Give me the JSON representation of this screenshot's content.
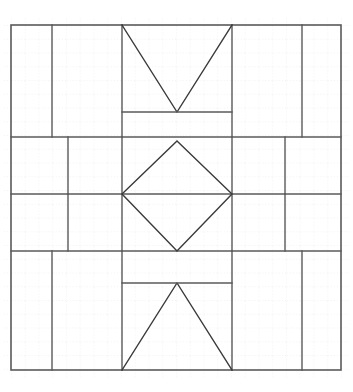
{
  "page": {
    "background_color": "#ffffff",
    "width": 353,
    "height": 392
  },
  "graph_paper": {
    "visible": true,
    "grid_spacing_px": 13.75,
    "minor_grid_color": "#e2e2ec",
    "minor_grid_dash": "1 2",
    "origin_x": 11,
    "origin_y": 25
  },
  "figure": {
    "type": "line-drawing",
    "stroke_color": "#5a5a5a",
    "stroke_color_dark": "#3a3a3a",
    "stroke_width_outer": 1.6,
    "stroke_width_inner": 1.4,
    "fill": "none",
    "frame": {
      "x1": 11,
      "y1": 25,
      "x2": 341,
      "y2": 370
    },
    "bands": {
      "horizontal_rules_y": [
        25,
        137,
        194,
        251,
        370
      ],
      "top_band_verticals_x": [
        52,
        122,
        232,
        302
      ],
      "middle_band_verticals_x": [
        68,
        122,
        232,
        285
      ],
      "bottom_band_verticals_x": [
        52,
        122,
        232,
        302
      ]
    },
    "shapes": [
      {
        "name": "outer-frame",
        "kind": "rect",
        "points": [
          [
            11,
            25
          ],
          [
            341,
            25
          ],
          [
            341,
            370
          ],
          [
            11,
            370
          ]
        ]
      },
      {
        "name": "top-chevron",
        "kind": "polyline",
        "points": [
          [
            122,
            25
          ],
          [
            177,
            112
          ],
          [
            232,
            25
          ]
        ]
      },
      {
        "name": "top-chevron-base",
        "kind": "line",
        "points": [
          [
            122,
            112
          ],
          [
            232,
            112
          ]
        ]
      },
      {
        "name": "center-diamond",
        "kind": "polygon",
        "points": [
          [
            177,
            141
          ],
          [
            232,
            194
          ],
          [
            177,
            251
          ],
          [
            122,
            194
          ]
        ]
      },
      {
        "name": "bottom-chevron",
        "kind": "polyline",
        "points": [
          [
            122,
            370
          ],
          [
            177,
            283
          ],
          [
            232,
            370
          ]
        ]
      },
      {
        "name": "bottom-chevron-base",
        "kind": "line",
        "points": [
          [
            122,
            283
          ],
          [
            232,
            283
          ]
        ]
      }
    ]
  }
}
